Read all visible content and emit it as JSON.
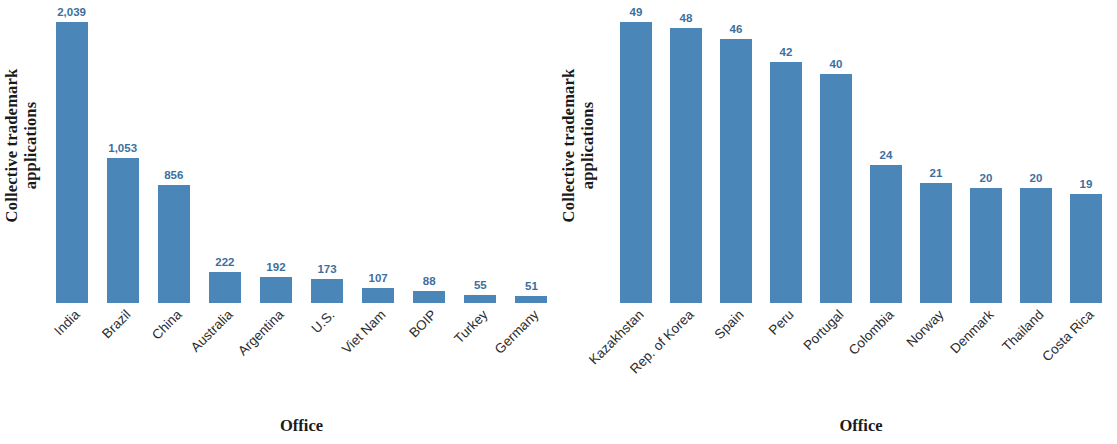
{
  "colors": {
    "bar": "#4a86b8",
    "value_label": "#3d6f9e",
    "axis_text": "#1a1a1a",
    "background": "#ffffff"
  },
  "panels": [
    {
      "id": "left",
      "ylabel_line1": "Collective trademark",
      "ylabel_line2": "applications",
      "xlabel": "Office"
    },
    {
      "id": "right",
      "ylabel_line1": "Collective trademark",
      "ylabel_line2": "applications",
      "xlabel": "Office"
    }
  ],
  "chart_data": [
    {
      "type": "bar",
      "title": "",
      "xlabel": "Office",
      "ylabel": "Collective trademark applications",
      "grid": false,
      "legend": false,
      "ylim": [
        0,
        2039
      ],
      "categories": [
        "India",
        "Brazil",
        "China",
        "Australia",
        "Argentina",
        "U.S.",
        "Viet Nam",
        "BOIP",
        "Turkey",
        "Germany"
      ],
      "values": [
        2039,
        1053,
        856,
        222,
        192,
        173,
        107,
        88,
        55,
        51
      ],
      "value_labels": [
        "2,039",
        "1,053",
        "856",
        "222",
        "192",
        "173",
        "107",
        "88",
        "55",
        "51"
      ]
    },
    {
      "type": "bar",
      "title": "",
      "xlabel": "Office",
      "ylabel": "Collective trademark applications",
      "grid": false,
      "legend": false,
      "ylim": [
        0,
        49
      ],
      "categories": [
        "Kazakhstan",
        "Rep. of Korea",
        "Spain",
        "Peru",
        "Portugal",
        "Colombia",
        "Norway",
        "Denmark",
        "Thailand",
        "Costa Rica"
      ],
      "values": [
        49,
        48,
        46,
        42,
        40,
        24,
        21,
        20,
        20,
        19
      ],
      "value_labels": [
        "49",
        "48",
        "46",
        "42",
        "40",
        "24",
        "21",
        "20",
        "20",
        "19"
      ]
    }
  ]
}
